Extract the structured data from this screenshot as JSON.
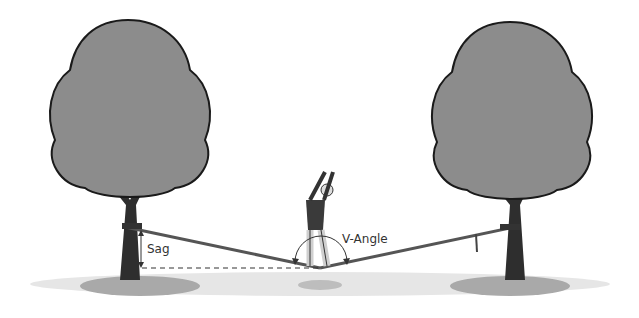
{
  "labels": {
    "sag": "Sag",
    "v_angle": "V-Angle"
  },
  "colors": {
    "foliage": "#8c8c8c",
    "trunk": "#2e2e2e",
    "ground_shadow": "#a9a9a9",
    "line": "#555555"
  }
}
